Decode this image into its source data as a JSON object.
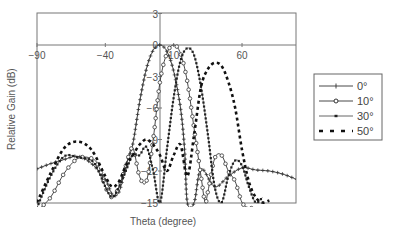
{
  "chart_data": {
    "type": "line",
    "title": "",
    "xlabel": "Theta (degree)",
    "ylabel": "Relative Gain (dB)",
    "xlim": [
      -90,
      100
    ],
    "ylim": [
      -15,
      3
    ],
    "x_ticks": [
      "-90",
      "-40",
      "10",
      "60"
    ],
    "y_ticks": [
      "3",
      "0",
      "-3",
      "-6",
      "-9",
      "-12",
      "-15"
    ],
    "grid": false,
    "legend_position": "right",
    "series": [
      {
        "name": "0°",
        "marker": "plus",
        "x": [
          -90,
          -80,
          -70,
          -60,
          -50,
          -40,
          -35,
          -30,
          -25,
          -20,
          -15,
          -10,
          -5,
          0,
          5,
          10,
          15,
          18,
          20,
          25,
          30,
          40,
          50,
          60,
          70,
          80,
          90,
          100
        ],
        "y": [
          -11.8,
          -11.3,
          -10.9,
          -10.6,
          -11.3,
          -12.8,
          -14.2,
          -14.0,
          -11.5,
          -9.5,
          -5.5,
          -2.3,
          -0.5,
          0,
          -0.6,
          -2.5,
          -6.0,
          -10.0,
          -15.0,
          -15.0,
          -11.8,
          -13.5,
          -12.5,
          -11.7,
          -11.9,
          -12.0,
          -12.3,
          -12.8
        ]
      },
      {
        "name": "10°",
        "marker": "circle",
        "x": [
          -90,
          -80,
          -70,
          -60,
          -50,
          -45,
          -40,
          -35,
          -30,
          -25,
          -20,
          -15,
          -10,
          -5,
          0,
          5,
          10,
          15,
          20,
          25,
          30,
          33,
          35,
          40,
          45,
          50,
          55,
          60,
          65,
          70
        ],
        "y": [
          -17,
          -14.5,
          -12.2,
          -10.8,
          -10.8,
          -11.5,
          -13.5,
          -14.5,
          -13.5,
          -11.5,
          -9.8,
          -12.5,
          -13.0,
          -9.0,
          -3.5,
          -0.8,
          0,
          -0.8,
          -3.5,
          -8.0,
          -12.5,
          -15.0,
          -14.0,
          -10.8,
          -10.5,
          -12.0,
          -13.0,
          -15.0,
          -15.5,
          -15.5
        ]
      },
      {
        "name": "30°",
        "marker": "square",
        "x": [
          -90,
          -80,
          -70,
          -60,
          -50,
          -45,
          -40,
          -35,
          -30,
          -25,
          -20,
          -15,
          -10,
          -5,
          0,
          5,
          10,
          15,
          20,
          25,
          30,
          35,
          40,
          45,
          50,
          55,
          60,
          65,
          70,
          75
        ],
        "y": [
          -15.5,
          -12.5,
          -10.6,
          -10.7,
          -11.0,
          -12.0,
          -13.5,
          -14.5,
          -13.5,
          -12.0,
          -10.5,
          -10.5,
          -9.7,
          -12.0,
          -15.0,
          -10.0,
          -5.0,
          -1.5,
          -0.3,
          -1.0,
          -4.0,
          -8.5,
          -13.5,
          -15.0,
          -12.5,
          -11.0,
          -11.5,
          -13.5,
          -15.0,
          -14.5
        ]
      },
      {
        "name": "50°",
        "marker": "dash",
        "x": [
          -90,
          -80,
          -70,
          -60,
          -50,
          -40,
          -35,
          -30,
          -25,
          -20,
          -15,
          -10,
          -5,
          0,
          5,
          10,
          15,
          20,
          25,
          30,
          35,
          40,
          45,
          50,
          55,
          60,
          65,
          70,
          75,
          80
        ],
        "y": [
          -15.0,
          -12.2,
          -9.8,
          -9.2,
          -10.0,
          -12.5,
          -13.5,
          -13.0,
          -11.5,
          -10.5,
          -9.5,
          -9.0,
          -9.5,
          -10.5,
          -12.0,
          -10.5,
          -9.5,
          -12.5,
          -8.5,
          -4.0,
          -2.3,
          -1.7,
          -2.0,
          -3.5,
          -6.0,
          -10.0,
          -13.0,
          -14.5,
          -15.0,
          -14.8
        ]
      }
    ]
  }
}
